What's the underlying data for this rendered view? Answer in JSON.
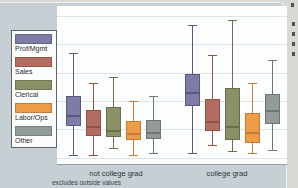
{
  "figure": {
    "title": "",
    "footnote": "excludes outside values",
    "background_color": "#c6cfd3",
    "plot_background_color": "#fcfdfd"
  },
  "chart_data": {
    "type": "boxplot",
    "title": "",
    "xlabel": "",
    "ylabel": "",
    "y_axis_unlabeled": true,
    "units_note": "y-axis has no tick labels in image; values are relative 0-100 of plot height (0 = bottom axis line)",
    "grid": "horizontal",
    "legend_position": "left",
    "note": "excludes outside values",
    "groups": [
      "not college grad",
      "college grad"
    ],
    "series": [
      {
        "name": "Prof/Mgmt",
        "color": "#7c7ca6",
        "line_color": "#5a5a80",
        "boxes": [
          {
            "whisker_low": 6,
            "q1": 24,
            "median": 31,
            "q3": 43,
            "whisker_high": 70
          },
          {
            "whisker_low": 7,
            "q1": 37,
            "median": 45,
            "q3": 57,
            "whisker_high": 88
          }
        ]
      },
      {
        "name": "Sales",
        "color": "#b26d60",
        "line_color": "#8e5247",
        "boxes": [
          {
            "whisker_low": 6,
            "q1": 18,
            "median": 24,
            "q3": 34,
            "whisker_high": 51
          },
          {
            "whisker_low": 12,
            "q1": 21,
            "median": 27,
            "q3": 41,
            "whisker_high": 69
          }
        ]
      },
      {
        "name": "Clerical",
        "color": "#8a9166",
        "line_color": "#68704a",
        "boxes": [
          {
            "whisker_low": 10,
            "q1": 17,
            "median": 21,
            "q3": 36,
            "whisker_high": 55
          },
          {
            "whisker_low": 8,
            "q1": 15,
            "median": 24,
            "q3": 48,
            "whisker_high": 91
          }
        ]
      },
      {
        "name": "Labor/Ops",
        "color": "#eb9c45",
        "line_color": "#c47a3a",
        "boxes": [
          {
            "whisker_low": 6,
            "q1": 15,
            "median": 19,
            "q3": 27,
            "whisker_high": 40
          },
          {
            "whisker_low": 7,
            "q1": 13,
            "median": 20,
            "q3": 32,
            "whisker_high": 51
          }
        ]
      },
      {
        "name": "Other",
        "color": "#939b9a",
        "line_color": "#6e7675",
        "boxes": [
          {
            "whisker_low": 7,
            "q1": 16,
            "median": 20,
            "q3": 28,
            "whisker_high": 43
          },
          {
            "whisker_low": 9,
            "q1": 25,
            "median": 34,
            "q3": 44,
            "whisker_high": 66
          }
        ]
      }
    ]
  },
  "page_edge": {
    "cutoff_text_fragments": 5
  }
}
